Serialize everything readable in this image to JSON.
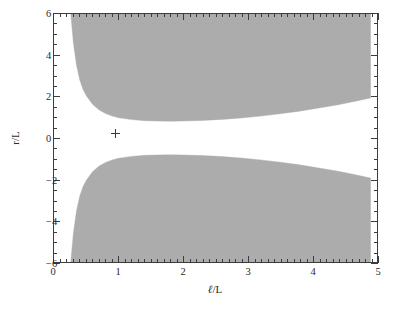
{
  "chart_data": {
    "type": "area",
    "title": "",
    "xlabel": "ℓ/L",
    "ylabel": "r/L",
    "xlim": [
      0,
      5
    ],
    "ylim": [
      -6,
      6
    ],
    "grid": false,
    "legend": null,
    "x_ticks": [
      0,
      1,
      2,
      3,
      4,
      5
    ],
    "x_tick_labels": [
      "0",
      "1",
      "2",
      "3",
      "4",
      "5"
    ],
    "x_minor_step": 0.1,
    "y_ticks": [
      6,
      4,
      2,
      0,
      -2,
      -4,
      -6
    ],
    "y_tick_labels": [
      "6",
      "4",
      "2",
      "0",
      "−2",
      "−4",
      "−6"
    ],
    "y_minor_step": 0.5,
    "fill_color": "#acacac",
    "frame_color": "#3c3c3c",
    "background": "#ffffff",
    "series": [
      {
        "name": "upper-shaded-region",
        "type": "band",
        "description": "Shaded region bounded below by an inner envelope and above by y = 6 (top of axes), starting at x = 0.26.",
        "x": [
          0.26,
          0.3,
          0.35,
          0.4,
          0.45,
          0.5,
          0.6,
          0.7,
          0.8,
          0.9,
          1.0,
          1.2,
          1.4,
          1.6,
          1.8,
          2.0,
          2.3,
          2.6,
          2.9,
          3.2,
          3.5,
          3.8,
          4.1,
          4.4,
          4.7,
          4.9
        ],
        "y_lower": [
          6.0,
          4.6,
          3.5,
          2.8,
          2.35,
          2.05,
          1.62,
          1.35,
          1.18,
          1.06,
          0.98,
          0.89,
          0.84,
          0.82,
          0.81,
          0.82,
          0.85,
          0.9,
          0.97,
          1.06,
          1.17,
          1.3,
          1.45,
          1.61,
          1.8,
          1.94
        ],
        "y_upper": 6.0
      },
      {
        "name": "lower-shaded-region",
        "type": "band",
        "description": "Mirror image of the upper region about r/L = 0; bounded above by the inner envelope and below by y = -6.",
        "x": [
          0.26,
          0.3,
          0.35,
          0.4,
          0.45,
          0.5,
          0.6,
          0.7,
          0.8,
          0.9,
          1.0,
          1.2,
          1.4,
          1.6,
          1.8,
          2.0,
          2.3,
          2.6,
          2.9,
          3.2,
          3.5,
          3.8,
          4.1,
          4.4,
          4.7,
          4.9
        ],
        "y_upper": [
          -6.0,
          -4.6,
          -3.5,
          -2.8,
          -2.35,
          -2.05,
          -1.62,
          -1.35,
          -1.18,
          -1.06,
          -0.98,
          -0.89,
          -0.84,
          -0.82,
          -0.81,
          -0.82,
          -0.85,
          -0.9,
          -0.97,
          -1.06,
          -1.17,
          -1.3,
          -1.45,
          -1.61,
          -1.8,
          -1.94
        ],
        "y_lower": -6.0
      }
    ],
    "annotations": [
      {
        "name": "cross-marker",
        "marker": "+",
        "x": 0.96,
        "y": 0.22,
        "color": "#3a3a3a"
      }
    ]
  }
}
